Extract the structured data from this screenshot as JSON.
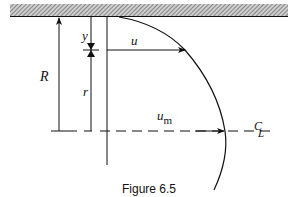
{
  "figure": {
    "caption": "Figure 6.5",
    "labels": {
      "R": "R",
      "y": "y",
      "r": "r",
      "u": "u",
      "u_m_base": "u",
      "u_m_sub": "m",
      "centerline_top": "C",
      "centerline_bottom": "L"
    },
    "colors": {
      "ink": "#111111",
      "wall_hatch": "#888888"
    }
  }
}
